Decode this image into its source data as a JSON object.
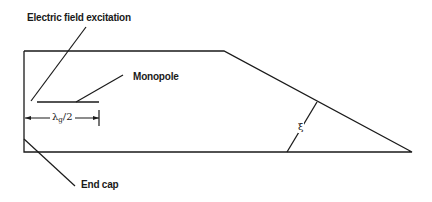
{
  "diagram": {
    "labels": {
      "excitation": "Electric field excitation",
      "monopole": "Monopole",
      "end_cap": "End cap",
      "dimension_symbol": "λ",
      "dimension_subscript": "g",
      "dimension_suffix": "/2",
      "angle": "ξ"
    },
    "shape": {
      "description": "Tapered waveguide cavity with end cap on left and sloped taper to right tip",
      "stroke_color": "#1a1a1a",
      "background": "#ffffff"
    }
  }
}
